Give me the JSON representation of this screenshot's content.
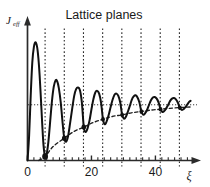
{
  "figure": {
    "title": "Lattice planes",
    "y_axis_label_main": "J",
    "y_axis_label_sub": "eff",
    "x_axis_label": "ξ",
    "ink_color": "#111111",
    "axis_color": "#2b2b2b",
    "background": "#ffffff"
  },
  "chart_data": {
    "type": "line",
    "title": "Lattice planes",
    "xlabel": "ξ",
    "ylabel": "J_eff",
    "xlim": [
      0,
      53
    ],
    "ylim": [
      0,
      1.18
    ],
    "grid": false,
    "legend": null,
    "xticks_major": [
      0,
      20,
      40
    ],
    "xtick_labels": [
      "0",
      "20",
      "40"
    ],
    "xticks_minor": [
      2,
      4,
      6,
      8,
      10,
      12,
      14,
      16,
      18,
      22,
      24,
      26,
      28,
      30,
      32,
      34,
      36,
      38,
      42,
      44,
      46,
      48,
      50
    ],
    "yticks": [],
    "ytick_labels": [],
    "annotations": {
      "lattice_plane_positions": [
        5.5,
        11.5,
        17.5,
        23.5,
        29.5,
        35.5,
        41.5,
        47.5
      ],
      "lattice_plane_spacing": 6.0,
      "asymptote_value": 0.5,
      "asymptote_style": "dotted",
      "markers_on_minima": [
        {
          "x": 5.5,
          "y": 0.035
        },
        {
          "x": 11.5,
          "y": 0.2
        },
        {
          "x": 17.6,
          "y": 0.3
        },
        {
          "x": 23.6,
          "y": 0.37
        },
        {
          "x": 29.6,
          "y": 0.41
        },
        {
          "x": 35.6,
          "y": 0.44
        },
        {
          "x": 41.6,
          "y": 0.46
        },
        {
          "x": 47.6,
          "y": 0.475
        }
      ]
    },
    "series": [
      {
        "name": "J_eff (damped oscillation)",
        "style": "solid",
        "x": [
          0.0,
          0.5,
          1.0,
          1.5,
          2.0,
          2.5,
          3.0,
          3.4,
          3.8,
          4.2,
          4.6,
          5.0,
          5.5,
          6.0,
          6.5,
          7.0,
          7.6,
          8.2,
          8.8,
          9.3,
          9.8,
          10.4,
          11.0,
          11.5,
          12.1,
          12.7,
          13.3,
          14.0,
          14.6,
          15.2,
          15.8,
          16.4,
          17.0,
          17.6,
          18.2,
          18.8,
          19.4,
          20.0,
          20.6,
          21.2,
          21.8,
          22.4,
          23.0,
          23.6,
          24.2,
          24.8,
          25.4,
          26.0,
          26.6,
          27.2,
          27.8,
          28.4,
          29.0,
          29.6,
          30.2,
          30.8,
          31.4,
          32.0,
          32.6,
          33.2,
          33.8,
          34.4,
          35.0,
          35.6,
          36.2,
          36.8,
          37.4,
          38.0,
          38.6,
          39.2,
          39.8,
          40.4,
          41.0,
          41.6,
          42.2,
          42.8,
          43.4,
          44.0,
          44.6,
          45.2,
          45.8,
          46.4,
          47.0,
          47.6,
          48.2,
          48.8,
          49.4,
          50.0,
          50.6,
          51.0
        ],
        "y": [
          0.0,
          0.22,
          0.58,
          0.88,
          1.02,
          1.06,
          1.02,
          0.92,
          0.76,
          0.55,
          0.33,
          0.14,
          0.035,
          0.06,
          0.16,
          0.32,
          0.52,
          0.66,
          0.72,
          0.71,
          0.65,
          0.52,
          0.33,
          0.2,
          0.17,
          0.22,
          0.33,
          0.47,
          0.58,
          0.64,
          0.655,
          0.63,
          0.52,
          0.3,
          0.255,
          0.29,
          0.36,
          0.46,
          0.55,
          0.61,
          0.625,
          0.6,
          0.52,
          0.37,
          0.325,
          0.355,
          0.41,
          0.48,
          0.545,
          0.59,
          0.6,
          0.58,
          0.52,
          0.41,
          0.375,
          0.395,
          0.44,
          0.49,
          0.545,
          0.575,
          0.585,
          0.565,
          0.52,
          0.44,
          0.41,
          0.425,
          0.455,
          0.5,
          0.54,
          0.565,
          0.57,
          0.555,
          0.52,
          0.46,
          0.435,
          0.445,
          0.47,
          0.5,
          0.535,
          0.555,
          0.56,
          0.548,
          0.52,
          0.475,
          0.455,
          0.46,
          0.48,
          0.505,
          0.528,
          0.535
        ]
      },
      {
        "name": "envelope (lower, dashed)",
        "style": "dashed",
        "x": [
          3.5,
          5.5,
          8.0,
          11.5,
          14.5,
          17.6,
          20.5,
          23.6,
          26.5,
          29.6,
          32.5,
          35.6,
          38.5,
          41.6,
          44.5,
          47.6,
          49.5,
          51.0
        ],
        "y": [
          0.0,
          0.035,
          0.125,
          0.2,
          0.26,
          0.3,
          0.34,
          0.37,
          0.395,
          0.41,
          0.428,
          0.44,
          0.452,
          0.46,
          0.468,
          0.475,
          0.478,
          0.48
        ]
      }
    ]
  }
}
